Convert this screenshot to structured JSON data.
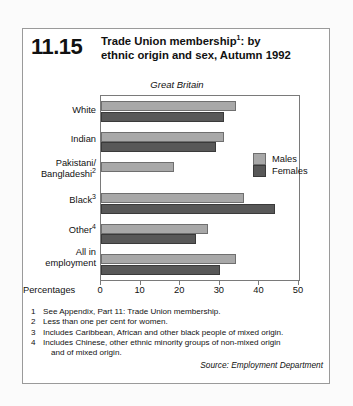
{
  "header": {
    "ref_number": "11.15",
    "title_line1": "Trade Union membership",
    "title_sup1": "1",
    "title_line1_end": ":  by",
    "title_line2": "ethnic origin and sex, Autumn 1992"
  },
  "region_label": "Great Britain",
  "axis": {
    "percentages_label": "Percentages",
    "ticks": [
      "0",
      "10",
      "20",
      "30",
      "40",
      "50"
    ]
  },
  "legend": {
    "males": "Males",
    "females": "Females"
  },
  "footnotes": [
    {
      "num": "1",
      "text": "See Appendix, Part 11: Trade Union membership."
    },
    {
      "num": "2",
      "text": "Less than one per cent for women."
    },
    {
      "num": "3",
      "text": "Includes Caribbean, African and other black people of mixed origin."
    },
    {
      "num": "4",
      "text": "Includes Chinese, other ethnic minority groups of non-mixed origin",
      "cont": "and of mixed origin."
    }
  ],
  "source": "Source: Employment Department",
  "colors": {
    "males": "#a8a8a8",
    "females": "#585858",
    "axis": "#7a7a7a",
    "text": "#111111"
  },
  "chart_data": {
    "type": "bar",
    "orientation": "horizontal",
    "subtitle": "Great Britain",
    "xlabel": "Percentages",
    "ylabel": "",
    "xlim": [
      0,
      50
    ],
    "xticks": [
      0,
      10,
      20,
      30,
      40,
      50
    ],
    "grid": false,
    "legend_position": "inside-right",
    "categories": [
      "White",
      "Indian",
      "Pakistani/ Bangladeshi",
      "Black",
      "Other",
      "All in employment"
    ],
    "category_labels": [
      {
        "line1": "White",
        "line2": "",
        "sup": ""
      },
      {
        "line1": "Indian",
        "line2": "",
        "sup": ""
      },
      {
        "line1": "Pakistani/",
        "line2": "Bangladeshi",
        "sup": "2"
      },
      {
        "line1": "Black",
        "line2": "",
        "sup": "3"
      },
      {
        "line1": "Other",
        "line2": "",
        "sup": "4"
      },
      {
        "line1": "All in",
        "line2": "employment",
        "sup": ""
      }
    ],
    "series": [
      {
        "name": "Males",
        "values": [
          34,
          31,
          18.5,
          36,
          27,
          34
        ]
      },
      {
        "name": "Females",
        "values": [
          31,
          29,
          0,
          44,
          24,
          30
        ]
      }
    ]
  }
}
